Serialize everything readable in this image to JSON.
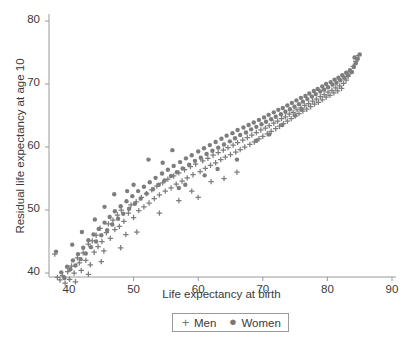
{
  "chart_data": {
    "type": "scatter",
    "title": "",
    "xlabel": "Life expectancy at birth",
    "ylabel": "Residual life expectancy at age 10",
    "xlim": [
      36.5,
      91.5
    ],
    "ylim": [
      36.0,
      82.5
    ],
    "xticks": [
      40,
      50,
      60,
      70,
      80,
      90
    ],
    "yticks": [
      40,
      50,
      60,
      70,
      80
    ],
    "grid": false,
    "legend_position": "below-axis-center",
    "marker_color": "#7d7d7d",
    "axis_color": "#9a9a9a",
    "text_color": "#3a3a3a",
    "series": [
      {
        "name": "Men",
        "marker": "plus",
        "color": "#7d7d7d",
        "points": [
          [
            37.8,
            43.0
          ],
          [
            38.2,
            39.3
          ],
          [
            38.6,
            38.9
          ],
          [
            39.0,
            39.6
          ],
          [
            39.4,
            38.4
          ],
          [
            39.8,
            40.2
          ],
          [
            40.1,
            39.0
          ],
          [
            40.4,
            41.1
          ],
          [
            40.8,
            40.0
          ],
          [
            41.0,
            38.6
          ],
          [
            41.3,
            42.4
          ],
          [
            41.6,
            41.6
          ],
          [
            41.9,
            40.4
          ],
          [
            42.2,
            43.2
          ],
          [
            42.6,
            42.0
          ],
          [
            43.0,
            44.6
          ],
          [
            43.3,
            41.3
          ],
          [
            43.6,
            45.1
          ],
          [
            43.9,
            43.3
          ],
          [
            44.2,
            46.0
          ],
          [
            44.5,
            44.2
          ],
          [
            44.8,
            47.1
          ],
          [
            45.1,
            45.0
          ],
          [
            45.4,
            43.5
          ],
          [
            45.8,
            46.4
          ],
          [
            46.1,
            47.8
          ],
          [
            46.4,
            45.5
          ],
          [
            46.8,
            48.4
          ],
          [
            47.1,
            46.9
          ],
          [
            47.5,
            49.2
          ],
          [
            47.8,
            47.4
          ],
          [
            48.1,
            50.0
          ],
          [
            48.5,
            48.2
          ],
          [
            48.8,
            46.1
          ],
          [
            49.2,
            49.5
          ],
          [
            49.6,
            50.8
          ],
          [
            50.0,
            48.8
          ],
          [
            50.4,
            51.3
          ],
          [
            50.8,
            49.9
          ],
          [
            51.2,
            52.0
          ],
          [
            51.6,
            50.5
          ],
          [
            52.0,
            52.6
          ],
          [
            52.4,
            51.1
          ],
          [
            52.8,
            53.2
          ],
          [
            53.2,
            51.8
          ],
          [
            53.6,
            53.8
          ],
          [
            54.0,
            52.4
          ],
          [
            54.5,
            54.3
          ],
          [
            54.9,
            53.0
          ],
          [
            55.3,
            54.9
          ],
          [
            55.8,
            53.5
          ],
          [
            56.2,
            55.4
          ],
          [
            56.6,
            54.1
          ],
          [
            57.0,
            55.9
          ],
          [
            57.5,
            54.6
          ],
          [
            57.9,
            56.4
          ],
          [
            58.3,
            55.1
          ],
          [
            58.8,
            56.9
          ],
          [
            59.2,
            55.6
          ],
          [
            59.6,
            57.3
          ],
          [
            60.0,
            52.0
          ],
          [
            60.3,
            56.1
          ],
          [
            60.7,
            57.8
          ],
          [
            61.1,
            56.6
          ],
          [
            61.5,
            58.2
          ],
          [
            61.9,
            57.1
          ],
          [
            62.3,
            58.7
          ],
          [
            62.7,
            57.5
          ],
          [
            63.1,
            59.1
          ],
          [
            63.5,
            58.0
          ],
          [
            63.9,
            59.5
          ],
          [
            64.2,
            58.4
          ],
          [
            64.6,
            59.9
          ],
          [
            65.0,
            58.8
          ],
          [
            65.4,
            60.3
          ],
          [
            65.8,
            59.2
          ],
          [
            66.1,
            60.7
          ],
          [
            66.5,
            59.6
          ],
          [
            66.9,
            61.1
          ],
          [
            67.2,
            60.0
          ],
          [
            67.6,
            61.5
          ],
          [
            68.0,
            60.4
          ],
          [
            68.3,
            61.9
          ],
          [
            68.7,
            60.8
          ],
          [
            69.0,
            62.3
          ],
          [
            69.4,
            61.3
          ],
          [
            69.7,
            62.7
          ],
          [
            70.0,
            61.7
          ],
          [
            70.4,
            63.0
          ],
          [
            70.7,
            62.1
          ],
          [
            71.0,
            63.4
          ],
          [
            71.3,
            62.5
          ],
          [
            71.7,
            63.8
          ],
          [
            72.0,
            62.9
          ],
          [
            72.3,
            64.1
          ],
          [
            72.6,
            63.3
          ],
          [
            72.9,
            64.5
          ],
          [
            73.2,
            63.7
          ],
          [
            73.5,
            64.8
          ],
          [
            73.8,
            64.1
          ],
          [
            74.1,
            65.2
          ],
          [
            74.4,
            64.5
          ],
          [
            74.7,
            65.5
          ],
          [
            75.0,
            64.9
          ],
          [
            75.3,
            65.9
          ],
          [
            75.6,
            65.3
          ],
          [
            75.9,
            66.2
          ],
          [
            76.2,
            65.7
          ],
          [
            76.5,
            66.6
          ],
          [
            76.8,
            66.0
          ],
          [
            77.1,
            66.9
          ],
          [
            77.4,
            66.4
          ],
          [
            77.7,
            67.3
          ],
          [
            78.0,
            66.8
          ],
          [
            78.3,
            67.6
          ],
          [
            78.6,
            67.1
          ],
          [
            78.9,
            68.0
          ],
          [
            79.2,
            67.5
          ],
          [
            79.5,
            68.3
          ],
          [
            79.8,
            67.9
          ],
          [
            80.1,
            68.7
          ],
          [
            80.4,
            68.2
          ],
          [
            80.7,
            69.0
          ],
          [
            81.0,
            68.6
          ],
          [
            81.3,
            69.4
          ],
          [
            81.6,
            68.9
          ],
          [
            81.9,
            69.7
          ],
          [
            82.2,
            69.3
          ],
          [
            82.5,
            70.1
          ],
          [
            82.9,
            70.6
          ],
          [
            83.2,
            71.2
          ],
          [
            83.6,
            71.9
          ],
          [
            84.0,
            72.8
          ],
          [
            84.4,
            73.6
          ],
          [
            84.8,
            74.5
          ],
          [
            59.0,
            53.0
          ],
          [
            62.0,
            54.5
          ],
          [
            64.0,
            55.0
          ],
          [
            66.0,
            56.0
          ],
          [
            57.0,
            51.5
          ],
          [
            54.0,
            49.5
          ],
          [
            50.5,
            46.5
          ],
          [
            48.0,
            44.0
          ],
          [
            45.0,
            41.8
          ],
          [
            43.0,
            39.8
          ]
        ]
      },
      {
        "name": "Women",
        "marker": "circle",
        "color": "#7d7d7d",
        "points": [
          [
            38.0,
            43.4
          ],
          [
            38.8,
            40.1
          ],
          [
            39.3,
            39.2
          ],
          [
            39.7,
            41.0
          ],
          [
            40.2,
            40.6
          ],
          [
            40.6,
            42.0
          ],
          [
            41.0,
            41.2
          ],
          [
            41.4,
            43.0
          ],
          [
            41.8,
            42.2
          ],
          [
            42.2,
            44.0
          ],
          [
            42.6,
            43.1
          ],
          [
            43.0,
            45.2
          ],
          [
            43.4,
            44.1
          ],
          [
            43.8,
            46.1
          ],
          [
            44.2,
            45.0
          ],
          [
            44.6,
            47.0
          ],
          [
            45.0,
            46.0
          ],
          [
            45.5,
            48.0
          ],
          [
            45.9,
            46.8
          ],
          [
            46.3,
            48.9
          ],
          [
            46.7,
            47.7
          ],
          [
            47.1,
            49.8
          ],
          [
            47.6,
            48.6
          ],
          [
            48.0,
            50.6
          ],
          [
            48.4,
            49.4
          ],
          [
            48.9,
            51.4
          ],
          [
            49.3,
            50.2
          ],
          [
            49.8,
            52.2
          ],
          [
            50.2,
            51.0
          ],
          [
            50.7,
            53.0
          ],
          [
            51.1,
            51.8
          ],
          [
            51.6,
            53.7
          ],
          [
            52.0,
            52.6
          ],
          [
            52.5,
            54.4
          ],
          [
            53.0,
            53.3
          ],
          [
            53.4,
            55.1
          ],
          [
            53.9,
            54.0
          ],
          [
            54.4,
            55.8
          ],
          [
            54.8,
            54.7
          ],
          [
            55.3,
            56.4
          ],
          [
            55.8,
            55.4
          ],
          [
            56.2,
            57.0
          ],
          [
            56.7,
            56.0
          ],
          [
            57.2,
            57.6
          ],
          [
            57.6,
            56.6
          ],
          [
            58.1,
            58.2
          ],
          [
            58.6,
            57.2
          ],
          [
            59.0,
            58.7
          ],
          [
            59.5,
            57.8
          ],
          [
            60.0,
            59.3
          ],
          [
            60.4,
            58.3
          ],
          [
            60.9,
            59.8
          ],
          [
            61.3,
            58.9
          ],
          [
            61.8,
            60.3
          ],
          [
            62.2,
            59.4
          ],
          [
            62.7,
            60.8
          ],
          [
            63.1,
            59.9
          ],
          [
            63.6,
            61.3
          ],
          [
            64.0,
            60.4
          ],
          [
            64.4,
            61.8
          ],
          [
            64.9,
            60.9
          ],
          [
            65.3,
            62.2
          ],
          [
            65.7,
            61.4
          ],
          [
            66.1,
            62.7
          ],
          [
            66.5,
            61.9
          ],
          [
            67.0,
            63.1
          ],
          [
            67.4,
            62.3
          ],
          [
            67.8,
            63.5
          ],
          [
            68.2,
            62.8
          ],
          [
            68.6,
            63.9
          ],
          [
            69.0,
            63.2
          ],
          [
            69.4,
            64.3
          ],
          [
            69.8,
            63.6
          ],
          [
            70.2,
            64.7
          ],
          [
            70.5,
            64.0
          ],
          [
            70.9,
            65.1
          ],
          [
            71.3,
            64.4
          ],
          [
            71.7,
            65.5
          ],
          [
            72.0,
            64.8
          ],
          [
            72.4,
            65.9
          ],
          [
            72.8,
            65.2
          ],
          [
            73.1,
            66.2
          ],
          [
            73.5,
            65.6
          ],
          [
            73.8,
            66.6
          ],
          [
            74.2,
            66.0
          ],
          [
            74.5,
            67.0
          ],
          [
            74.9,
            66.4
          ],
          [
            75.2,
            67.4
          ],
          [
            75.6,
            66.8
          ],
          [
            75.9,
            67.8
          ],
          [
            76.2,
            67.2
          ],
          [
            76.6,
            68.1
          ],
          [
            76.9,
            67.6
          ],
          [
            77.2,
            68.5
          ],
          [
            77.6,
            68.0
          ],
          [
            77.9,
            68.9
          ],
          [
            78.2,
            68.4
          ],
          [
            78.5,
            69.2
          ],
          [
            78.9,
            68.8
          ],
          [
            79.2,
            69.6
          ],
          [
            79.5,
            69.1
          ],
          [
            79.8,
            70.0
          ],
          [
            80.1,
            69.5
          ],
          [
            80.5,
            70.3
          ],
          [
            80.8,
            69.9
          ],
          [
            81.1,
            70.7
          ],
          [
            81.4,
            70.2
          ],
          [
            81.7,
            71.0
          ],
          [
            82.0,
            70.6
          ],
          [
            82.3,
            71.4
          ],
          [
            82.6,
            71.0
          ],
          [
            82.9,
            71.8
          ],
          [
            83.2,
            71.4
          ],
          [
            83.5,
            72.2
          ],
          [
            83.8,
            71.9
          ],
          [
            84.1,
            72.7
          ],
          [
            84.4,
            73.3
          ],
          [
            84.7,
            74.0
          ],
          [
            85.0,
            74.7
          ],
          [
            84.2,
            74.2
          ],
          [
            52.3,
            58.0
          ],
          [
            54.5,
            57.5
          ],
          [
            57.0,
            53.5
          ],
          [
            61.0,
            55.5
          ],
          [
            63.0,
            56.5
          ],
          [
            47.0,
            52.5
          ],
          [
            50.0,
            54.0
          ],
          [
            44.0,
            48.5
          ],
          [
            58.0,
            54.0
          ],
          [
            66.0,
            58.0
          ],
          [
            69.0,
            61.0
          ],
          [
            71.0,
            62.0
          ],
          [
            73.0,
            63.5
          ],
          [
            75.0,
            65.0
          ],
          [
            76.0,
            66.0
          ],
          [
            42.0,
            46.5
          ],
          [
            40.5,
            44.5
          ],
          [
            45.5,
            50.5
          ],
          [
            49.0,
            53.0
          ],
          [
            56.0,
            59.5
          ]
        ]
      }
    ]
  },
  "legend": {
    "men_symbol": "+",
    "men_label": "Men",
    "women_symbol": "●",
    "women_label": "Women"
  }
}
